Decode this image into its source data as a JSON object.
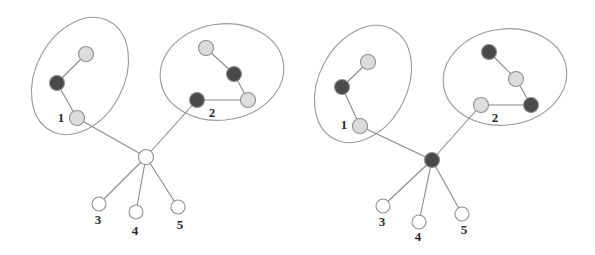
{
  "figure": {
    "width": 595,
    "height": 255,
    "background": "#ffffff"
  },
  "palette": {
    "dark_node_fill": "#4a4a4a",
    "light_node_fill": "#dcdcdc",
    "white_node_fill": "#ffffff",
    "node_stroke": "#8f8f8f",
    "edge_stroke": "#8a8a8a",
    "hull_stroke": "#9a9a9a",
    "label_color": "#2b2b2b"
  },
  "geometry": {
    "node_radius": 7.5,
    "leaf_radius": 7.0
  },
  "panels": [
    {
      "id": "panel-left",
      "name": "left-panel",
      "hulls": [
        {
          "id": "hull-left-1",
          "name": "cluster-1-outline",
          "cx": 80,
          "cy": 76,
          "rx": 44,
          "ry": 62,
          "rotation": 28
        },
        {
          "id": "hull-left-2",
          "name": "cluster-2-outline",
          "cx": 222,
          "cy": 72,
          "rx": 62,
          "ry": 48,
          "rotation": -8
        }
      ],
      "nodes": [
        {
          "id": "L-c1-a",
          "name": "cluster-1-light-node-a",
          "cx": 86,
          "cy": 54,
          "shade": "light",
          "label": ""
        },
        {
          "id": "L-c1-b",
          "name": "cluster-1-dark-node-b",
          "cx": 57,
          "cy": 83,
          "shade": "dark",
          "label": ""
        },
        {
          "id": "L-c1-1",
          "name": "cluster-1-boundary-node-1",
          "cx": 77,
          "cy": 118,
          "shade": "light",
          "label": "1",
          "label_x": 61,
          "label_y": 119
        },
        {
          "id": "L-c2-a",
          "name": "cluster-2-light-node-a",
          "cx": 206,
          "cy": 48,
          "shade": "light",
          "label": ""
        },
        {
          "id": "L-c2-b",
          "name": "cluster-2-dark-node-b",
          "cx": 234,
          "cy": 74,
          "shade": "dark",
          "label": ""
        },
        {
          "id": "L-c2-c",
          "name": "cluster-2-light-node-c",
          "cx": 248,
          "cy": 100,
          "shade": "light",
          "label": ""
        },
        {
          "id": "L-c2-2",
          "name": "cluster-2-boundary-node-2",
          "cx": 197,
          "cy": 100,
          "shade": "dark",
          "label": "2",
          "label_x": 212,
          "label_y": 114
        },
        {
          "id": "L-hub",
          "name": "hub-node",
          "cx": 146,
          "cy": 157,
          "shade": "white",
          "label": ""
        },
        {
          "id": "L-leaf3",
          "name": "leaf-node-3",
          "cx": 99,
          "cy": 204,
          "shade": "white",
          "label": "3",
          "label_x": 98,
          "label_y": 221
        },
        {
          "id": "L-leaf4",
          "name": "leaf-node-4",
          "cx": 136,
          "cy": 212,
          "shade": "white",
          "label": "4",
          "label_x": 135,
          "label_y": 232
        },
        {
          "id": "L-leaf5",
          "name": "leaf-node-5",
          "cx": 178,
          "cy": 207,
          "shade": "white",
          "label": "5",
          "label_x": 180,
          "label_y": 226
        }
      ],
      "edges": [
        {
          "name": "edge-c1-a-b",
          "from": "L-c1-a",
          "to": "L-c1-b"
        },
        {
          "name": "edge-c1-b-1",
          "from": "L-c1-b",
          "to": "L-c1-1"
        },
        {
          "name": "edge-c2-a-b",
          "from": "L-c2-a",
          "to": "L-c2-b"
        },
        {
          "name": "edge-c2-b-c",
          "from": "L-c2-b",
          "to": "L-c2-c"
        },
        {
          "name": "edge-c2-2-c",
          "from": "L-c2-2",
          "to": "L-c2-c"
        },
        {
          "name": "edge-1-hub",
          "from": "L-c1-1",
          "to": "L-hub"
        },
        {
          "name": "edge-2-hub",
          "from": "L-c2-2",
          "to": "L-hub"
        },
        {
          "name": "edge-hub-leaf3",
          "from": "L-hub",
          "to": "L-leaf3"
        },
        {
          "name": "edge-hub-leaf4",
          "from": "L-hub",
          "to": "L-leaf4"
        },
        {
          "name": "edge-hub-leaf5",
          "from": "L-hub",
          "to": "L-leaf5"
        }
      ]
    },
    {
      "id": "panel-right",
      "name": "right-panel",
      "hulls": [
        {
          "id": "hull-right-1",
          "name": "cluster-1-outline",
          "cx": 363,
          "cy": 84,
          "rx": 44,
          "ry": 62,
          "rotation": 28
        },
        {
          "id": "hull-right-2",
          "name": "cluster-2-outline",
          "cx": 505,
          "cy": 77,
          "rx": 62,
          "ry": 48,
          "rotation": -8
        }
      ],
      "nodes": [
        {
          "id": "R-c1-a",
          "name": "cluster-1-light-node-a",
          "cx": 368,
          "cy": 62,
          "shade": "light",
          "label": ""
        },
        {
          "id": "R-c1-b",
          "name": "cluster-1-dark-node-b",
          "cx": 342,
          "cy": 87,
          "shade": "dark",
          "label": ""
        },
        {
          "id": "R-c1-1",
          "name": "cluster-1-boundary-node-1",
          "cx": 360,
          "cy": 126,
          "shade": "light",
          "label": "1",
          "label_x": 344,
          "label_y": 126
        },
        {
          "id": "R-c2-a",
          "name": "cluster-2-dark-node-a",
          "cx": 489,
          "cy": 52,
          "shade": "dark",
          "label": ""
        },
        {
          "id": "R-c2-b",
          "name": "cluster-2-light-node-b",
          "cx": 516,
          "cy": 79,
          "shade": "light",
          "label": ""
        },
        {
          "id": "R-c2-c",
          "name": "cluster-2-dark-node-c",
          "cx": 531,
          "cy": 105,
          "shade": "dark",
          "label": ""
        },
        {
          "id": "R-c2-2",
          "name": "cluster-2-boundary-node-2",
          "cx": 481,
          "cy": 105,
          "shade": "light",
          "label": "2",
          "label_x": 495,
          "label_y": 119
        },
        {
          "id": "R-hub",
          "name": "hub-node",
          "cx": 432,
          "cy": 160,
          "shade": "dark",
          "label": ""
        },
        {
          "id": "R-leaf3",
          "name": "leaf-node-3",
          "cx": 383,
          "cy": 206,
          "shade": "white",
          "label": "3",
          "label_x": 382,
          "label_y": 223
        },
        {
          "id": "R-leaf4",
          "name": "leaf-node-4",
          "cx": 419,
          "cy": 222,
          "shade": "white",
          "label": "4",
          "label_x": 418,
          "label_y": 238
        },
        {
          "id": "R-leaf5",
          "name": "leaf-node-5",
          "cx": 462,
          "cy": 214,
          "shade": "white",
          "label": "5",
          "label_x": 464,
          "label_y": 231
        }
      ],
      "edges": [
        {
          "name": "edge-c1-a-b",
          "from": "R-c1-a",
          "to": "R-c1-b"
        },
        {
          "name": "edge-c1-b-1",
          "from": "R-c1-b",
          "to": "R-c1-1"
        },
        {
          "name": "edge-c2-a-b",
          "from": "R-c2-a",
          "to": "R-c2-b"
        },
        {
          "name": "edge-c2-b-c",
          "from": "R-c2-b",
          "to": "R-c2-c"
        },
        {
          "name": "edge-c2-2-c",
          "from": "R-c2-2",
          "to": "R-c2-c"
        },
        {
          "name": "edge-1-hub",
          "from": "R-c1-1",
          "to": "R-hub"
        },
        {
          "name": "edge-2-hub",
          "from": "R-c2-2",
          "to": "R-hub"
        },
        {
          "name": "edge-hub-leaf3",
          "from": "R-hub",
          "to": "R-leaf3"
        },
        {
          "name": "edge-hub-leaf4",
          "from": "R-hub",
          "to": "R-leaf4"
        },
        {
          "name": "edge-hub-leaf5",
          "from": "R-hub",
          "to": "R-leaf5"
        }
      ]
    }
  ]
}
